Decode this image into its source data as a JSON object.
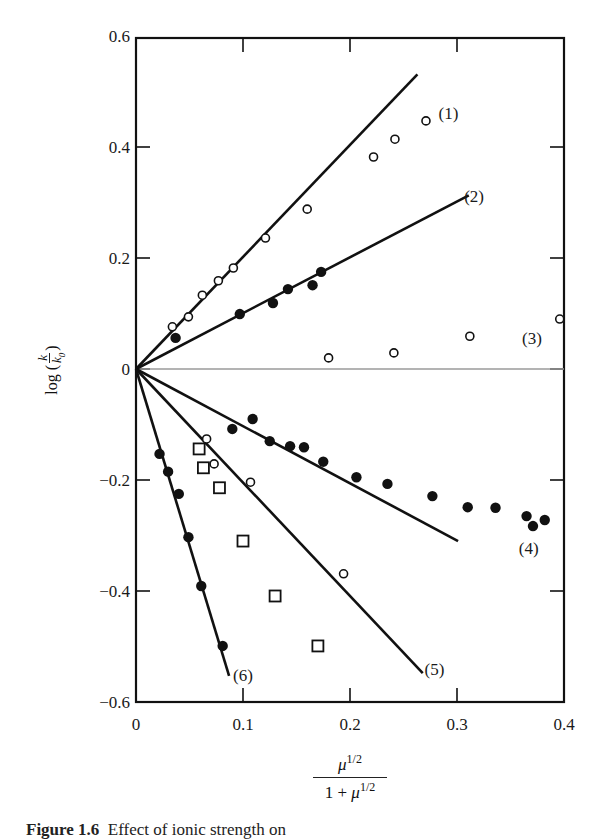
{
  "chart_data": {
    "type": "scatter",
    "title": "",
    "xlabel": "μ^1/2 / (1 + μ^1/2)",
    "ylabel": "log (k/k0)",
    "xlim": [
      0,
      0.4
    ],
    "ylim": [
      -0.6,
      0.6
    ],
    "grid": false,
    "legend_position": "inline series labels",
    "x_ticks": [
      "0",
      "0.1",
      "0.2",
      "0.3",
      "0.4"
    ],
    "y_ticks": [
      "0.6",
      "0.4",
      "0.2",
      "0",
      "−0.2",
      "−0.4",
      "−0.6"
    ],
    "reference_line": {
      "y": 0,
      "style": "thin gray"
    },
    "series": [
      {
        "name": "(1)",
        "marker": "open-circle",
        "fit_line": [
          [
            0,
            0
          ],
          [
            0.263,
            0.531
          ]
        ],
        "points": [
          [
            0.034,
            0.076
          ],
          [
            0.049,
            0.094
          ],
          [
            0.062,
            0.133
          ],
          [
            0.077,
            0.159
          ],
          [
            0.091,
            0.182
          ],
          [
            0.121,
            0.236
          ],
          [
            0.16,
            0.288
          ],
          [
            0.222,
            0.382
          ],
          [
            0.242,
            0.414
          ],
          [
            0.271,
            0.447
          ]
        ],
        "label_pos": [
          0.292,
          0.461
        ]
      },
      {
        "name": "(2)",
        "marker": "filled-circle",
        "fit_line": [
          [
            0,
            0
          ],
          [
            0.311,
            0.313
          ]
        ],
        "points": [
          [
            0.037,
            0.056
          ],
          [
            0.097,
            0.099
          ],
          [
            0.128,
            0.119
          ],
          [
            0.142,
            0.144
          ],
          [
            0.165,
            0.151
          ],
          [
            0.173,
            0.175
          ]
        ],
        "label_pos": [
          0.316,
          0.312
        ]
      },
      {
        "name": "(3)",
        "marker": "open-circle",
        "fit_line": null,
        "points": [
          [
            0.18,
            0.02
          ],
          [
            0.241,
            0.029
          ],
          [
            0.312,
            0.059
          ],
          [
            0.396,
            0.09
          ]
        ],
        "label_pos": [
          0.37,
          0.056
        ]
      },
      {
        "name": "(4)",
        "marker": "filled-circle",
        "fit_line": [
          [
            0,
            0
          ],
          [
            0.301,
            -0.31
          ]
        ],
        "points": [
          [
            0.09,
            -0.108
          ],
          [
            0.109,
            -0.09
          ],
          [
            0.125,
            -0.13
          ],
          [
            0.144,
            -0.139
          ],
          [
            0.157,
            -0.141
          ],
          [
            0.175,
            -0.167
          ],
          [
            0.206,
            -0.195
          ],
          [
            0.235,
            -0.207
          ],
          [
            0.277,
            -0.229
          ],
          [
            0.31,
            -0.249
          ],
          [
            0.336,
            -0.25
          ],
          [
            0.365,
            -0.265
          ],
          [
            0.371,
            -0.283
          ],
          [
            0.382,
            -0.272
          ]
        ],
        "label_pos": [
          0.367,
          -0.322
        ]
      },
      {
        "name": "(5)",
        "marker": "open-circle",
        "fit_line": [
          [
            0,
            0
          ],
          [
            0.268,
            -0.548
          ]
        ],
        "points": [
          [
            0.066,
            -0.126
          ],
          [
            0.073,
            -0.171
          ],
          [
            0.107,
            -0.204
          ],
          [
            0.194,
            -0.369
          ]
        ],
        "label_pos": [
          0.279,
          -0.54
        ]
      },
      {
        "name": "squares",
        "marker": "open-square",
        "fit_line": null,
        "points": [
          [
            0.059,
            -0.144
          ],
          [
            0.063,
            -0.178
          ],
          [
            0.078,
            -0.214
          ],
          [
            0.1,
            -0.31
          ],
          [
            0.13,
            -0.409
          ],
          [
            0.17,
            -0.499
          ]
        ]
      },
      {
        "name": "(6)",
        "marker": "filled-circle",
        "fit_line": [
          [
            0,
            0
          ],
          [
            0.087,
            -0.553
          ]
        ],
        "points": [
          [
            0.022,
            -0.153
          ],
          [
            0.03,
            -0.185
          ],
          [
            0.04,
            -0.225
          ],
          [
            0.049,
            -0.303
          ],
          [
            0.061,
            -0.391
          ],
          [
            0.081,
            -0.499
          ]
        ],
        "label_pos": [
          0.1,
          -0.552
        ]
      }
    ]
  },
  "axes": {
    "x_title_numerator": "μ",
    "x_title_numerator_sup": "1/2",
    "x_title_denominator": "1 + ",
    "x_title_denominator_mu": "μ",
    "x_title_denominator_sup": "1/2",
    "y_title_prefix": "log (",
    "y_title_num": "k",
    "y_title_den": "k",
    "y_title_den_sub": "0",
    "y_title_suffix": ")"
  },
  "caption": {
    "label": "Figure 1.6",
    "text": "Effect of ionic strength on"
  }
}
